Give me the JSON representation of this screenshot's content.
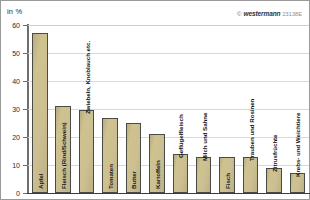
{
  "figure": {
    "axis_unit_label": "in %",
    "credit": {
      "copyright_mark": "©",
      "brand": "westermann",
      "code": "23138E"
    }
  },
  "chart_data": {
    "type": "bar",
    "title": "",
    "subtitle": "",
    "xlabel": "",
    "ylabel": "in %",
    "ylim": [
      0,
      60
    ],
    "yticks": [
      0,
      10,
      20,
      30,
      40,
      50,
      60
    ],
    "grid": true,
    "legend": "none",
    "orientation": "vertical",
    "bar_label_rotation": -90,
    "categories": [
      "Apfel",
      "Fleisch (Rind/Schwein)",
      "Zwiebeln, Knoblauch etc.",
      "Tomaten",
      "Butter",
      "Kartoffeln",
      "Geflügelfleisch",
      "Milch und Sahne",
      "Fisch",
      "Trauben und Rosinen",
      "Zitrusfrüchte",
      "Krebs- und Weichtiere"
    ],
    "values": [
      57,
      31,
      29.5,
      26.7,
      25,
      21,
      14,
      13,
      12.8,
      13,
      9,
      7
    ],
    "colors": {
      "bar_fill": "#ccc093",
      "bar_border": "#4a4a46",
      "gridline": "#d9d9d9",
      "axis": "#3b3b3b",
      "text": "#1a1a1a",
      "frame": "#9a9a9a"
    }
  }
}
